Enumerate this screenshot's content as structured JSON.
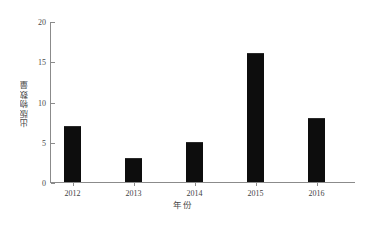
{
  "chart_data": {
    "type": "bar",
    "title": "",
    "subtitle": "",
    "categories": [
      "2012",
      "2013",
      "2014",
      "2015",
      "2016"
    ],
    "values": [
      7,
      3,
      5,
      16,
      8
    ],
    "xlabel": "年份",
    "ylabel": "出版物数量",
    "ylim": [
      0,
      20
    ],
    "yticks": [
      "0",
      "5",
      "10",
      "15",
      "20"
    ],
    "ytick_values": [
      0,
      5,
      10,
      15,
      20
    ],
    "grid": false,
    "legend": null,
    "bar_color": "#0d0d0d",
    "axis_color": "#8b8b8b",
    "background": "#ffffff",
    "annotations": []
  }
}
